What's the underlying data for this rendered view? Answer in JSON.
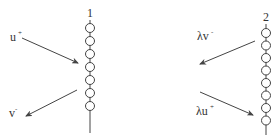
{
  "diagram": {
    "colors": {
      "stroke": "#444444",
      "text": "#333333",
      "background": "#ffffff"
    },
    "chains": [
      {
        "id": "1",
        "label": "1",
        "x": 90,
        "label_y": 17,
        "line_top": 20,
        "line_bottom": 133,
        "bead_count": 7,
        "bead_start_y": 28,
        "bead_spacing": 13,
        "bead_radius": 4.5
      },
      {
        "id": "2",
        "label": "2",
        "x": 266,
        "label_y": 21,
        "line_top": 24,
        "line_bottom": 135,
        "bead_count": 8,
        "bead_start_y": 33,
        "bead_spacing": 12.5,
        "bead_radius": 4.5
      }
    ],
    "arrows": [
      {
        "id": "u-plus",
        "base": "u",
        "sup": "+",
        "label_x": 10,
        "label_y": 41,
        "sup_dx": 8,
        "sup_dy": -6,
        "x1": 22,
        "y1": 38,
        "x2": 78,
        "y2": 63
      },
      {
        "id": "v-minus",
        "base": "v",
        "sup": "-",
        "label_x": 9,
        "label_y": 117,
        "sup_dx": 6,
        "sup_dy": -6,
        "x1": 77,
        "y1": 90,
        "x2": 26,
        "y2": 116
      },
      {
        "id": "lambda-v-minus",
        "base": "λv",
        "sup": "-",
        "label_x": 197,
        "label_y": 40,
        "sup_dx": 14,
        "sup_dy": -6,
        "x1": 255,
        "y1": 41,
        "x2": 200,
        "y2": 64
      },
      {
        "id": "lambda-u-plus",
        "base": "λu",
        "sup": "+",
        "label_x": 196,
        "label_y": 115,
        "sup_dx": 14,
        "sup_dy": -6,
        "x1": 200,
        "y1": 92,
        "x2": 253,
        "y2": 115
      }
    ]
  }
}
